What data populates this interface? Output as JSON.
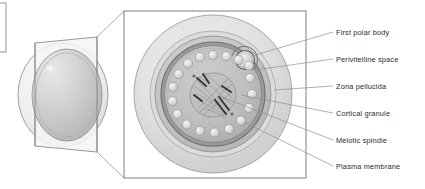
{
  "figure": {
    "type": "biological-diagram",
    "style": "grayscale line-and-shade illustration"
  },
  "colors": {
    "ink": "#2b2b2b",
    "line": "#6f6f6f",
    "leader_line": "#8a8a8a",
    "box_border": "#707070",
    "box_fill": "#ffffff",
    "zona_pellucida": "#d9d9d9",
    "zona_pellucida_outer": "#e6e6e6",
    "perivitelline_space": "#c4c4c4",
    "plasma_membrane": "#8f8f8f",
    "cytoplasm": "#bdbdbd",
    "cortical_granule": "#dedede",
    "spindle": "#9a9a9a",
    "chromosome": "#3a3a3a",
    "sphere_body": "#ededed",
    "sphere_inner": "#c9c9c9",
    "highlight": "#ffffff",
    "plane": "#f2f2f2"
  },
  "overview": {
    "name": "whole-oocyte-3d-view",
    "description": "Three-dimensional sphere of the oocyte with a tilted sectioning plane passing through it",
    "has_specular_highlight": true,
    "crop_marker": {
      "name": "edge-crop-rectangle",
      "description": "Thin rectangle outline clipped at the left edge of the image"
    }
  },
  "detail_box": {
    "name": "detail-panel",
    "description": "Rectangular magnified cross-section panel connected to the sectioning plane by two perspective lines",
    "border": true
  },
  "structures": [
    {
      "id": "first-polar-body",
      "label": "First polar body",
      "description": "Small round body lying in a notch of the perivitelline space at the upper right"
    },
    {
      "id": "perivitelline-space",
      "label": "Perivitelline space",
      "description": "Narrow gap between the zona pellucida and the plasma membrane"
    },
    {
      "id": "zona-pellucida",
      "label": "Zona pellucida",
      "description": "Thick translucent outer glycoprotein coat"
    },
    {
      "id": "cortical-granule",
      "label": "Cortical granule",
      "description": "Ring of small pale spheres lying just beneath the plasma membrane"
    },
    {
      "id": "meiotic-spindle",
      "label": "Meiotic spindle",
      "description": "Barrel-shaped spindle with dark chromosomes at the metaphase plate, near the cell centre"
    },
    {
      "id": "plasma-membrane",
      "label": "Plasma membrane",
      "description": "Dark boundary enclosing the ooplasm"
    }
  ],
  "labels": {
    "items": [
      {
        "text": "First polar body",
        "y": 34
      },
      {
        "text": "Perivitelline space",
        "y": 61
      },
      {
        "text": "Zona pellucida",
        "y": 88
      },
      {
        "text": "Cortical granule",
        "y": 115
      },
      {
        "text": "Meiotic spindle",
        "y": 142
      },
      {
        "text": "Plasma membrane",
        "y": 168
      }
    ],
    "text_left_x": 336
  },
  "counts": {
    "cortical_granules": 18,
    "labels": 6
  }
}
